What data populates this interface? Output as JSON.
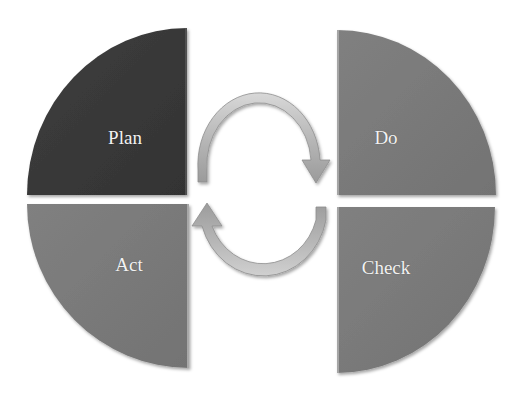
{
  "diagram": {
    "type": "pdca-cycle",
    "quadrants": [
      {
        "id": "plan",
        "label": "Plan",
        "position": "top-left",
        "color": "#3a3a3a"
      },
      {
        "id": "do",
        "label": "Do",
        "position": "top-right",
        "color": "#7a7a7a"
      },
      {
        "id": "act",
        "label": "Act",
        "position": "bottom-left",
        "color": "#7d7d7d"
      },
      {
        "id": "check",
        "label": "Check",
        "position": "bottom-right",
        "color": "#7a7a7a"
      }
    ],
    "arrows": [
      {
        "id": "upper-arrow",
        "direction": "clockwise",
        "from": "Plan",
        "to": "Do"
      },
      {
        "id": "lower-arrow",
        "direction": "clockwise",
        "from": "Check",
        "to": "Act"
      }
    ],
    "arrow_color": "#b5b5b5"
  }
}
